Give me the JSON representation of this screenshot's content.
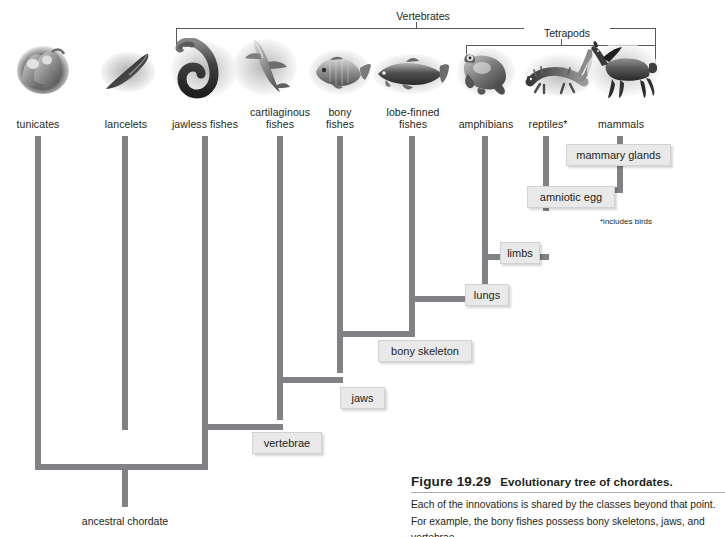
{
  "figure": {
    "number": "Figure 19.29",
    "title": "Evolutionary tree of chordates.",
    "body": "Each of the  innovations is shared by the classes beyond that point. For example, the bony fishes possess bony skeletons, jaws, and vertebrae."
  },
  "clades": [
    {
      "id": "vertebrates",
      "label": "Vertebrates"
    },
    {
      "id": "tetrapods",
      "label": "Tetrapods"
    }
  ],
  "taxa": [
    {
      "id": "tunicates",
      "label": "tunicates",
      "icon": "tunicate-illustration"
    },
    {
      "id": "lancelets",
      "label": "lancelets",
      "icon": "lancelet-illustration"
    },
    {
      "id": "jawless-fishes",
      "label": "jawless fishes",
      "icon": "lamprey-illustration"
    },
    {
      "id": "cartilaginous-fishes",
      "label": "cartilaginous\nfishes",
      "icon": "shark-illustration"
    },
    {
      "id": "bony-fishes",
      "label": "bony\nfishes",
      "icon": "bony-fish-illustration"
    },
    {
      "id": "lobe-finned-fishes",
      "label": "lobe-finned\nfishes",
      "icon": "lobe-finned-fish-illustration"
    },
    {
      "id": "amphibians",
      "label": "amphibians",
      "icon": "frog-illustration"
    },
    {
      "id": "reptiles",
      "label": "reptiles*",
      "icon": "lizard-illustration"
    },
    {
      "id": "mammals",
      "label": "mammals",
      "icon": "horse-illustration"
    }
  ],
  "innovations": [
    {
      "id": "mammary-glands",
      "label": "mammary glands"
    },
    {
      "id": "amniotic-egg",
      "label": "amniotic egg"
    },
    {
      "id": "limbs",
      "label": "limbs"
    },
    {
      "id": "lungs",
      "label": "lungs"
    },
    {
      "id": "bony-skeleton",
      "label": "bony skeleton"
    },
    {
      "id": "jaws",
      "label": "jaws"
    },
    {
      "id": "vertebrae",
      "label": "vertebrae"
    }
  ],
  "footnote": "*includes birds",
  "root": {
    "label": "ancestral chordate"
  },
  "colors": {
    "branch": "#808285",
    "box_fill": "#e9e9e9",
    "box_border": "#d2d2d2",
    "bracket": "#58595b",
    "text": "#231f20",
    "rule": "#a7a9ac"
  }
}
